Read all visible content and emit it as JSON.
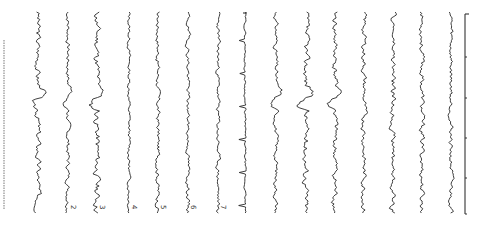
{
  "figure": {
    "orientation": "rotated-90",
    "type": "multichannel EEG trace plot",
    "channel_count": 16,
    "channels": [
      {
        "x": 38,
        "label": "",
        "amp": 3.0,
        "seed": 3,
        "event": true
      },
      {
        "x": 68,
        "label": "2",
        "amp": 2.2,
        "seed": 7,
        "event": true
      },
      {
        "x": 97,
        "label": "3",
        "amp": 3.4,
        "seed": 11,
        "event": true
      },
      {
        "x": 129,
        "label": "4",
        "amp": 1.6,
        "seed": 13,
        "event": false
      },
      {
        "x": 158,
        "label": "5",
        "amp": 2.2,
        "seed": 17,
        "event": false
      },
      {
        "x": 188,
        "label": "6",
        "amp": 2.0,
        "seed": 19,
        "event": false
      },
      {
        "x": 218,
        "label": "7",
        "amp": 2.0,
        "seed": 23,
        "event": false
      },
      {
        "x": 245,
        "label": "",
        "amp": 1.0,
        "seed": 29,
        "event": false,
        "ecg": true
      },
      {
        "x": 276,
        "label": "",
        "amp": 2.2,
        "seed": 31,
        "event": true
      },
      {
        "x": 306,
        "label": "",
        "amp": 3.2,
        "seed": 37,
        "event": true
      },
      {
        "x": 335,
        "label": "",
        "amp": 3.0,
        "seed": 41,
        "event": true
      },
      {
        "x": 364,
        "label": "",
        "amp": 2.6,
        "seed": 43,
        "event": false
      },
      {
        "x": 393,
        "label": "",
        "amp": 2.8,
        "seed": 47,
        "event": false
      },
      {
        "x": 422,
        "label": "",
        "amp": 2.6,
        "seed": 53,
        "event": false
      },
      {
        "x": 451,
        "label": "",
        "amp": 2.2,
        "seed": 59,
        "event": false
      }
    ],
    "side_text_column_x": 4,
    "time_axis": {
      "x": 465,
      "y_start": 14,
      "y_end": 214,
      "ticks": [
        14,
        57,
        98,
        138,
        178,
        214
      ]
    },
    "trace_range": {
      "y_start": 12,
      "y_end": 213
    },
    "colors": {
      "trace": "#2a2a2a",
      "background": "#ffffff"
    }
  }
}
